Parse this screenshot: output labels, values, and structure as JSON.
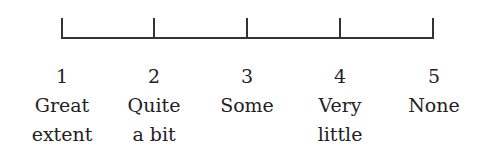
{
  "scale": {
    "points": [
      {
        "value": "1",
        "label_line1": "Great",
        "label_line2": "extent"
      },
      {
        "value": "2",
        "label_line1": "Quite",
        "label_line2": "a bit"
      },
      {
        "value": "3",
        "label_line1": "Some",
        "label_line2": ""
      },
      {
        "value": "4",
        "label_line1": "Very",
        "label_line2": "little"
      },
      {
        "value": "5",
        "label_line1": "None",
        "label_line2": ""
      }
    ],
    "line_color": "#333333"
  }
}
